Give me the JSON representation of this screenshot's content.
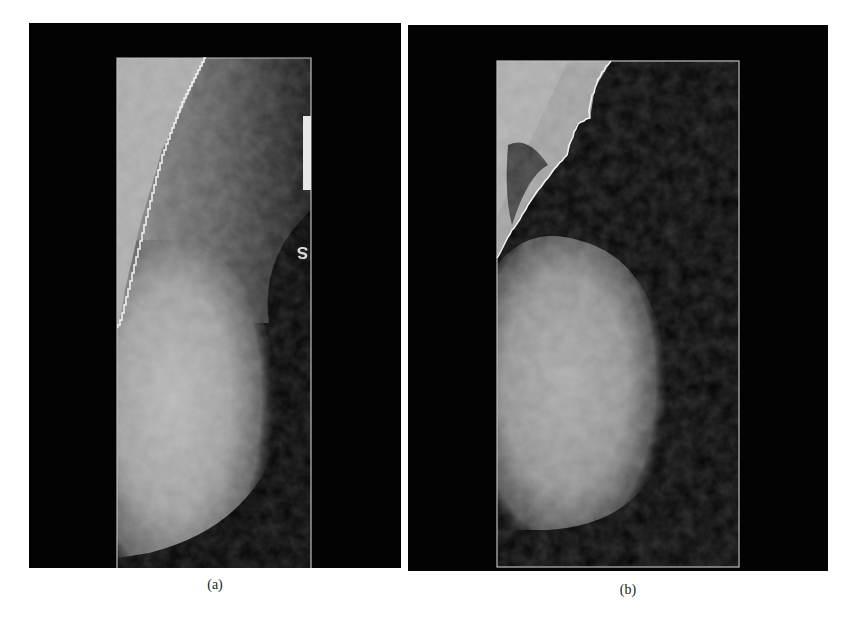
{
  "figure": {
    "panels": [
      {
        "id": "a",
        "caption": "(a)",
        "description": "Mammogram, mediolateral oblique view, with white stair-step segmentation contour along the pectoral muscle boundary and a region-of-interest rectangle",
        "orientation_marker": "S",
        "colors": {
          "background": "#030303",
          "contour": "#f2f2f2",
          "roi_border": "#bdbdbd",
          "pectoral": "#a9a9a9",
          "tissue": "#9a9a9a"
        }
      },
      {
        "id": "b",
        "caption": "(b)",
        "description": "Mammogram, mediolateral oblique view, with white jagged segmentation contour along the pectoral muscle boundary and a region-of-interest rectangle",
        "colors": {
          "background": "#030303",
          "contour": "#f2f2f2",
          "roi_border": "#bdbdbd",
          "pectoral": "#9c9c9c",
          "tissue": "#8e8e8e"
        }
      }
    ]
  }
}
